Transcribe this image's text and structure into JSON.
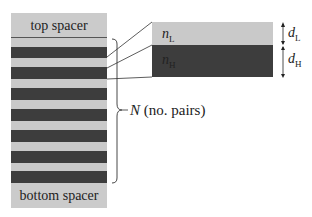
{
  "diagram": {
    "top_spacer_label": "top spacer",
    "bottom_spacer_label": "bottom spacer",
    "pairs_count_shown": 7,
    "brace_label_var": "N",
    "brace_label_text": " (no. pairs)",
    "layer_low": {
      "n_var": "n",
      "n_sub": "L",
      "d_var": "d",
      "d_sub": "L",
      "color": "#c9c9c9"
    },
    "layer_high": {
      "n_var": "n",
      "n_sub": "H",
      "d_var": "d",
      "d_sub": "H",
      "color": "#3d3d3d"
    },
    "spacer_color": "#cbcbcb"
  }
}
